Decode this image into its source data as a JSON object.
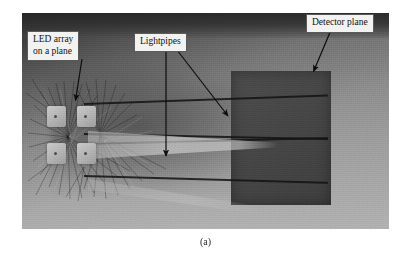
{
  "figure": {
    "caption": "(a)",
    "background_color": "#9a9a9a",
    "frame_color": "#ffffff"
  },
  "annotations": [
    {
      "id": "led-array",
      "label": "LED array\non a plane",
      "arrow_from": [
        82,
        59
      ],
      "arrow_to": [
        75,
        101
      ]
    },
    {
      "id": "lightpipes",
      "label": "Lightpipes",
      "arrow_from": [
        166,
        48
      ],
      "arrow_to": [
        166,
        157
      ],
      "arrow2_from": [
        176,
        48
      ],
      "arrow2_to": [
        229,
        117
      ]
    },
    {
      "id": "detector-plane",
      "label": "Detector plane",
      "arrow_from": [
        331,
        29
      ],
      "arrow_to": [
        313,
        72
      ]
    }
  ],
  "scene": {
    "led_array": {
      "name": "LED array on a plane",
      "rows": 2,
      "columns": 2,
      "count": 4,
      "color": "#bdbdbd"
    },
    "lightpipes": {
      "name": "Lightpipes",
      "count": 2,
      "color": "#4a4a4a"
    },
    "detector_plane": {
      "name": "Detector plane",
      "color": "#464646"
    }
  }
}
